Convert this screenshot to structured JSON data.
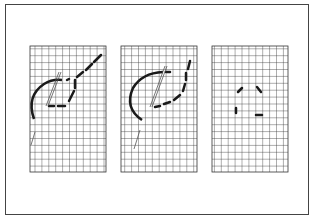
{
  "diagram": {
    "colors": {
      "frame": "#444444",
      "grid": "#333333",
      "thread": "#1a1a1a",
      "needle": "#555555",
      "background": "#ffffff"
    },
    "panels": [
      {
        "id": "step-1",
        "grid": {
          "x": 30,
          "y": 46,
          "cols": 11,
          "rows": 18,
          "cell": 6.9
        }
      },
      {
        "id": "step-2",
        "grid": {
          "x": 121,
          "y": 46,
          "cols": 11,
          "rows": 18,
          "cell": 6.9
        }
      },
      {
        "id": "step-3",
        "grid": {
          "x": 212,
          "y": 46,
          "cols": 11,
          "rows": 18,
          "cell": 6.9
        }
      }
    ]
  }
}
